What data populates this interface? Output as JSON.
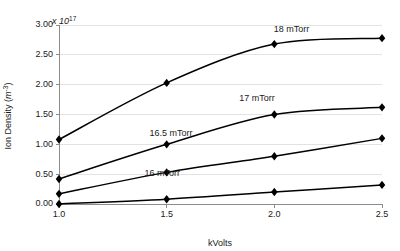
{
  "chart_data": {
    "type": "line",
    "title": "",
    "subtitle": "",
    "xlabel": "kVolts",
    "ylabel": "Ion Density (m⁻³)",
    "y_exponent_text": "x 10",
    "y_exponent_power": "17",
    "x": [
      1.0,
      1.5,
      2.0,
      2.5
    ],
    "xtick_labels": [
      "1.0",
      "1.5",
      "2.0",
      "2.5"
    ],
    "ytick_labels": [
      "0.00",
      "0.50",
      "1.00",
      "1.50",
      "2.00",
      "2.50",
      "3.00"
    ],
    "ytick_values": [
      0.0,
      0.5,
      1.0,
      1.5,
      2.0,
      2.5,
      3.0
    ],
    "xlim": [
      1.0,
      2.5
    ],
    "ylim": [
      0.0,
      3.0
    ],
    "grid": true,
    "legend_position": "inline-annotations",
    "marker": "diamond",
    "line_color": "#000000",
    "grid_color": "#e2e2e2",
    "axis_color": "#8c8c8c",
    "series": [
      {
        "name": "18 mTorr",
        "label": "18 mTorr",
        "values": [
          1.08,
          2.03,
          2.68,
          2.78
        ],
        "label_x": 2.08,
        "label_y": 2.88
      },
      {
        "name": "17 mTorr",
        "label": "17 mTorr",
        "values": [
          0.42,
          1.0,
          1.5,
          1.62
        ],
        "label_x": 1.92,
        "label_y": 1.72
      },
      {
        "name": "16.5 mTorr",
        "label": "16.5 mTorr",
        "values": [
          0.17,
          0.53,
          0.8,
          1.1
        ],
        "label_x": 1.52,
        "label_y": 1.14
      },
      {
        "name": "16 mTorr",
        "label": "16 mTorr",
        "values": [
          0.0,
          0.08,
          0.2,
          0.32
        ],
        "label_x": 1.48,
        "label_y": 0.47
      }
    ]
  }
}
